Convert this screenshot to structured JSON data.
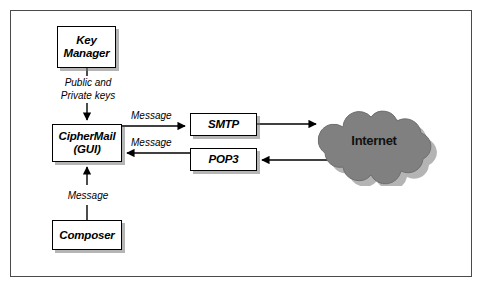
{
  "figure": {
    "background_color": "#ffffff",
    "frame_color": "#4a4a4a",
    "cloud_color": "#808080",
    "box_border_color": "#000000",
    "shadow_color": "#787878"
  },
  "nodes": {
    "key_manager": {
      "line1": "Key",
      "line2": "Manager"
    },
    "ciphermail": {
      "line1": "CipherMail",
      "line2": "(GUI)"
    },
    "composer": {
      "line1": "Composer"
    },
    "smtp": {
      "line1": "SMTP"
    },
    "pop3": {
      "line1": "POP3"
    },
    "internet": {
      "line1": "Internet"
    }
  },
  "edge_labels": {
    "keys": {
      "line1": "Public and",
      "line2": "Private keys"
    },
    "message_to_smtp": "Message",
    "message_from_pop3": "Message",
    "message_from_composer": "Message"
  },
  "edges": [
    {
      "from": "key_manager",
      "to": "ciphermail",
      "label": "Public and Private keys",
      "direction": "down"
    },
    {
      "from": "ciphermail",
      "to": "smtp",
      "label": "Message",
      "direction": "right"
    },
    {
      "from": "pop3",
      "to": "ciphermail",
      "label": "Message",
      "direction": "left"
    },
    {
      "from": "composer",
      "to": "ciphermail",
      "label": "Message",
      "direction": "up"
    },
    {
      "from": "smtp",
      "to": "internet",
      "label": "",
      "direction": "right"
    },
    {
      "from": "internet",
      "to": "pop3",
      "label": "",
      "direction": "left"
    }
  ]
}
